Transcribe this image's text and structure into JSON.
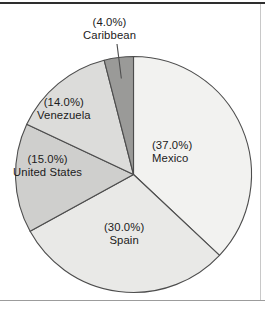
{
  "figure": {
    "background_color": "#ffffff",
    "frame": {
      "top_rule_color": "#2e2e2e",
      "bottom_rule_color": "#9c9c9c",
      "right_rule_color": "#c8c8c8"
    }
  },
  "chart_data": {
    "type": "pie",
    "title": "",
    "subtitle": "",
    "xlabel": "",
    "ylabel": "",
    "grid": false,
    "legend_position": "none",
    "labels_inside": true,
    "units": "percent",
    "start_angle_deg": 0,
    "direction": "clockwise",
    "categories": [
      "Mexico",
      "Spain",
      "United States",
      "Venezuela",
      "Caribbean"
    ],
    "values": [
      37.0,
      30.0,
      15.0,
      14.0,
      4.0
    ],
    "slices": [
      {
        "name": "Mexico",
        "value": 37.0,
        "percent_label": "(37.0%)",
        "name_label": "Mexico",
        "color": "#f2f2f0",
        "edge_color": "#4d4d4d",
        "start_deg": 0.0,
        "end_deg": 133.2,
        "has_leader_line": false
      },
      {
        "name": "Spain",
        "value": 30.0,
        "percent_label": "(30.0%)",
        "name_label": "Spain",
        "color": "#e9e9e7",
        "edge_color": "#4d4d4d",
        "start_deg": 133.2,
        "end_deg": 241.2,
        "has_leader_line": false
      },
      {
        "name": "United States",
        "value": 15.0,
        "percent_label": "(15.0%)",
        "name_label": "United States",
        "color": "#cfcfcd",
        "edge_color": "#4d4d4d",
        "start_deg": 241.2,
        "end_deg": 295.2,
        "has_leader_line": false
      },
      {
        "name": "Venezuela",
        "value": 14.0,
        "percent_label": "(14.0%)",
        "name_label": "Venezuela",
        "color": "#dcdcda",
        "edge_color": "#4d4d4d",
        "start_deg": 295.2,
        "end_deg": 345.6,
        "has_leader_line": false
      },
      {
        "name": "Caribbean",
        "value": 4.0,
        "percent_label": "(4.0%)",
        "name_label": "Caribbean",
        "color": "#9a9a98",
        "edge_color": "#4d4d4d",
        "start_deg": 345.6,
        "end_deg": 360.0,
        "has_leader_line": true
      }
    ]
  }
}
